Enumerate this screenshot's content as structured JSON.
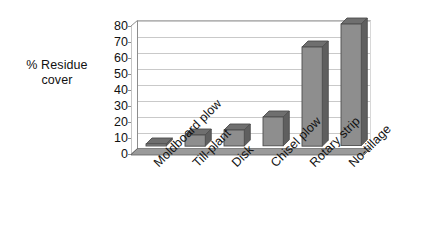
{
  "chart_data": {
    "type": "bar",
    "title": "",
    "subtitle": "",
    "xlabel": "",
    "ylabel": "% Residue cover",
    "ylabel_line1": "% Residue",
    "ylabel_line2": "cover",
    "categories": [
      "Moldboard plow",
      "Till-plant",
      "Disk",
      "Chisel plow",
      "Rotary strip",
      "No-tillage"
    ],
    "values": [
      1,
      7,
      10,
      18,
      62,
      76
    ],
    "series": [
      {
        "name": "% Residue cover",
        "values": [
          1,
          7,
          10,
          18,
          62,
          76
        ]
      }
    ],
    "ylim": [
      0,
      80
    ],
    "ytick_step": 10,
    "yticks": [
      "80",
      "70",
      "60",
      "50",
      "40",
      "30",
      "20",
      "10",
      "0"
    ],
    "ytick_values": [
      80,
      70,
      60,
      50,
      40,
      30,
      20,
      10,
      0
    ],
    "grid": true,
    "grid_axis": "y",
    "legend": false,
    "legend_position": "none",
    "style": "3d-column",
    "bar_color": "#8e8e8e",
    "bar_side_color": "#5f5f5f",
    "bar_top_color": "#6f6f6f",
    "bar_outline_color": "#4d4d4d",
    "grid_color": "#c9c9c9",
    "axis_color": "#8d8d8d",
    "text_color": "#111111",
    "background_color": "#ffffff",
    "xlabel_rotation": -45
  }
}
